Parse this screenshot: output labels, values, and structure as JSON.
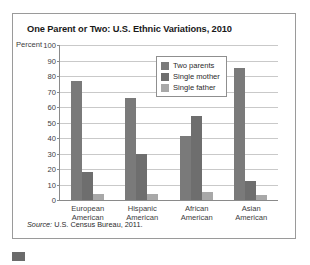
{
  "title": "One Parent or Two: U.S. Ethnic Variations, 2010",
  "source": {
    "prefix": "Source:",
    "text": " U.S. Census Bureau, 2011."
  },
  "axis": {
    "ylabel": "Percent",
    "yticks": [
      "100",
      "90",
      "80",
      "70",
      "60",
      "50",
      "40",
      "30",
      "20",
      "10",
      "0"
    ]
  },
  "legend": {
    "items": [
      {
        "label": "Two parents",
        "color": "#7a7a7a"
      },
      {
        "label": "Single mother",
        "color": "#6e6e6e"
      },
      {
        "label": "Single father",
        "color": "#a8a8a8"
      }
    ]
  },
  "categories_line1": [
    "European",
    "Hispanic",
    "African",
    "Asian"
  ],
  "categories_line2": [
    "American",
    "American",
    "American",
    "American"
  ],
  "chart_data": {
    "type": "bar",
    "title": "One Parent or Two: U.S. Ethnic Variations, 2010",
    "xlabel": "",
    "ylabel": "Percent",
    "ylim": [
      0,
      100
    ],
    "ytick_step": 10,
    "grid": true,
    "legend_position": "inside-top-center",
    "categories": [
      "European American",
      "Hispanic American",
      "African American",
      "Asian American"
    ],
    "series": [
      {
        "name": "Two parents",
        "color": "#7a7a7a",
        "values": [
          77,
          66,
          41,
          85
        ]
      },
      {
        "name": "Single mother",
        "color": "#6e6e6e",
        "values": [
          18,
          30,
          54,
          12
        ]
      },
      {
        "name": "Single father",
        "color": "#a8a8a8",
        "values": [
          4,
          4,
          5,
          3
        ]
      }
    ],
    "source": "Source: U.S. Census Bureau, 2011."
  }
}
